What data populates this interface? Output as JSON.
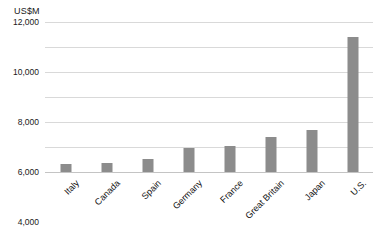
{
  "chart": {
    "axis_unit_label": "US$M",
    "bar_color": "#8c8c8c",
    "gridline_color": "#d9d9d9",
    "background_color": "#ffffff",
    "text_color": "#111111"
  },
  "chart_data": {
    "type": "bar",
    "title": "",
    "subtitle": "",
    "xlabel": "",
    "ylabel": "US$M",
    "ylim": [
      0,
      12000
    ],
    "yticks": [
      0,
      2000,
      4000,
      6000,
      8000,
      10000,
      12000
    ],
    "ytick_labels": [
      "0",
      "2,000",
      "4,000",
      "6,000",
      "8,000",
      "10,000",
      "12,000"
    ],
    "grid": true,
    "legend": false,
    "legend_position": "none",
    "categories": [
      "Italy",
      "Canada",
      "Spain",
      "Germany",
      "France",
      "Great Britain",
      "Japan",
      "U.S."
    ],
    "values": [
      620,
      760,
      1020,
      1900,
      2060,
      2800,
      3400,
      10800
    ],
    "series": [
      {
        "name": "",
        "values": [
          620,
          760,
          1020,
          1900,
          2060,
          2800,
          3400,
          10800
        ]
      }
    ]
  }
}
